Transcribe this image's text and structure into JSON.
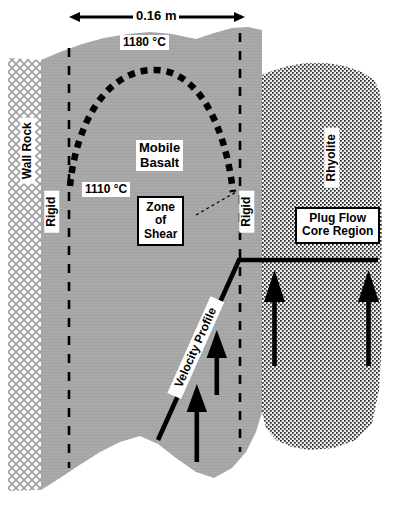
{
  "figure": {
    "dimension": {
      "label": "0.16 m",
      "arrow_name": "double-headed-dimension-arrow"
    },
    "labels": {
      "wall_rock": "Wall Rock",
      "rigid_left": "Rigid",
      "rigid_right": "Rigid",
      "temp_high": "1180 °C",
      "temp_low": "1110 °C",
      "mobile_basalt": "Mobile\nBasalt",
      "zone_of_shear": "Zone\nof\nShear",
      "rhyolite": "Rhyolite",
      "plug_flow": "Plug Flow\nCore Region",
      "velocity_profile": "Velocity Profile"
    },
    "colors": {
      "basalt_gray": "#a8a8a8",
      "wall_rock_fill": "#ffffff",
      "wall_rock_hatch": "#9a9a9a",
      "rhyolite_stipple": "#2b2b2b",
      "rhyolite_bg": "#e8e8e8",
      "line_black": "#000000",
      "page_white": "#ffffff"
    },
    "annotations": {
      "isotherm_style": "dotted-parabola",
      "shear_boundary_style": "vertical-dashed",
      "flow_arrow_count": 4,
      "flow_arrow_direction": "up"
    }
  }
}
